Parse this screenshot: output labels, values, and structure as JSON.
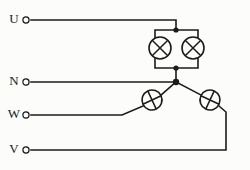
{
  "diagram": {
    "background_color": "#fcfcfa",
    "line_color": "#1b1b1b",
    "terminals": [
      {
        "label": "U",
        "id": "terminal-u",
        "y": 20,
        "label_x": 14,
        "ring_x": 26
      },
      {
        "label": "N",
        "id": "terminal-n",
        "y": 82,
        "label_x": 14,
        "ring_x": 26
      },
      {
        "label": "W",
        "id": "terminal-w",
        "y": 115,
        "label_x": 14,
        "ring_x": 26
      },
      {
        "label": "V",
        "id": "terminal-v",
        "y": 150,
        "label_x": 14,
        "ring_x": 26
      }
    ],
    "lamps": [
      {
        "id": "lamp-upper-left",
        "symbol": "lamp-cross-icon",
        "cx": 160,
        "cy": 48,
        "r": 11,
        "cross": "diagonal"
      },
      {
        "id": "lamp-upper-right",
        "symbol": "lamp-cross-icon",
        "cx": 193,
        "cy": 48,
        "r": 11,
        "cross": "diagonal"
      },
      {
        "id": "lamp-lower-left",
        "symbol": "lamp-cross-icon",
        "cx": 152,
        "cy": 100,
        "r": 10,
        "cross": "rotated"
      },
      {
        "id": "lamp-lower-right",
        "symbol": "lamp-cross-icon",
        "cx": 210,
        "cy": 100,
        "r": 10,
        "cross": "rotated"
      }
    ],
    "junctions": [
      {
        "id": "junction-top",
        "cx": 176,
        "cy": 30,
        "r": 2.6
      },
      {
        "id": "junction-mid",
        "cx": 176,
        "cy": 68,
        "r": 2.6
      },
      {
        "id": "junction-neutral",
        "cx": 176,
        "cy": 82,
        "r": 3.2
      }
    ],
    "caption": "",
    "corner_mark": ""
  }
}
